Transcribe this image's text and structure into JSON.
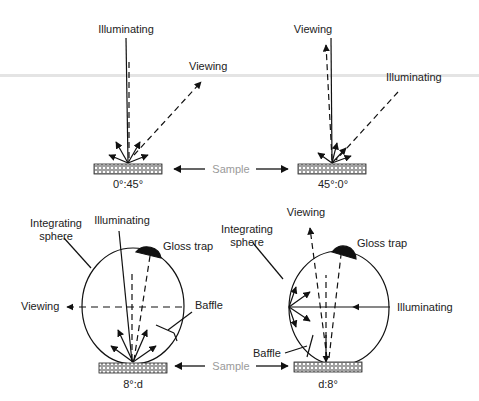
{
  "figure": {
    "colors": {
      "line": "#111111",
      "sample_label": "#9a9a9a",
      "scan_artifact": "#e4e4e4"
    }
  },
  "panels": {
    "top_left": {
      "geometry": "0°:45°",
      "illuminating_label": "Illuminating",
      "viewing_label": "Viewing"
    },
    "top_right": {
      "geometry": "45°:0°",
      "illuminating_label": "Illuminating",
      "viewing_label": "Viewing"
    },
    "bottom_left": {
      "geometry": "8°:d",
      "illuminating_label": "Illuminating",
      "viewing_label": "Viewing",
      "sphere_label_line1": "Integrating",
      "sphere_label_line2": "sphere",
      "gloss_trap_label": "Gloss trap",
      "baffle_label": "Baffle"
    },
    "bottom_right": {
      "geometry": "d:8°",
      "illuminating_label": "Illuminating",
      "viewing_label": "Viewing",
      "sphere_label_line1": "Integrating",
      "sphere_label_line2": "sphere",
      "gloss_trap_label": "Gloss trap",
      "baffle_label": "Baffle"
    }
  },
  "sample_labels": {
    "top": "Sample",
    "bottom": "Sample"
  }
}
